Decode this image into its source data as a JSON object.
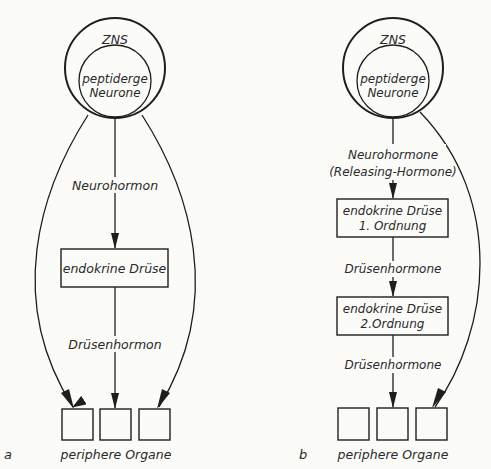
{
  "panels": {
    "a": {
      "id_label": "a",
      "outer_circle": "ZNS",
      "inner_circle": [
        "peptiderge",
        "Neurone"
      ],
      "arrow_label_1": "Neurohormon",
      "gland_box": "endokrine Drüse",
      "arrow_label_2": "Drüsenhormon",
      "organs_label": "periphere Organe",
      "organ_count": 3
    },
    "b": {
      "id_label": "b",
      "outer_circle": "ZNS",
      "inner_circle": [
        "peptiderge",
        "Neurone"
      ],
      "arrow_label_1": [
        "Neurohormone",
        "(Releasing-Hormone)"
      ],
      "gland_box_1": [
        "endokrine Drüse",
        "1. Ordnung"
      ],
      "arrow_label_2": "Drüsenhormone",
      "gland_box_2": [
        "endokrine Drüse",
        "2.Ordnung"
      ],
      "arrow_label_3": "Drüsenhormone",
      "organs_label": "periphere Organe",
      "organ_count": 3
    }
  }
}
